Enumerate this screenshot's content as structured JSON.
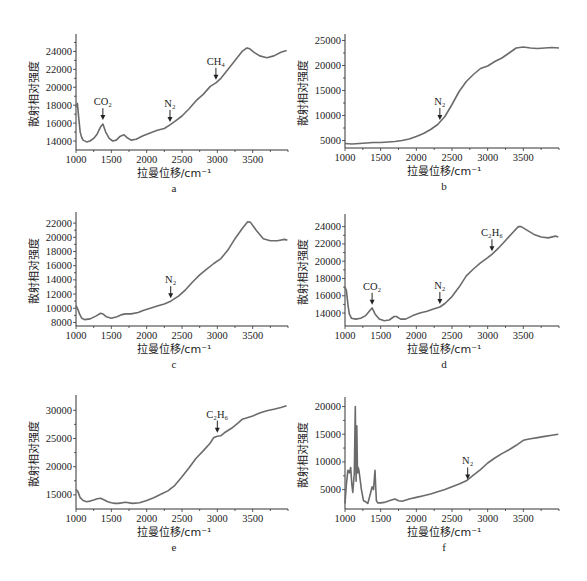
{
  "figure": {
    "panels": [
      "a",
      "b",
      "c",
      "d",
      "e",
      "f"
    ]
  },
  "chart_data": [
    {
      "id": "a",
      "type": "line",
      "title": "",
      "caption": "a",
      "xlabel": "拉曼位移/cm⁻¹",
      "ylabel": "散射相对强度",
      "xlim": [
        1000,
        4000
      ],
      "ylim": [
        13000,
        25500
      ],
      "xticks": [
        1000,
        1500,
        2000,
        2500,
        3000,
        3500
      ],
      "yticks": [
        14000,
        16000,
        18000,
        20000,
        22000,
        24000
      ],
      "grid": false,
      "annotations": [
        {
          "label": "CO₂",
          "x": 1380,
          "y": 16000
        },
        {
          "label": "N₂",
          "x": 2330,
          "y": 15800
        },
        {
          "label": "CH₄",
          "x": 2980,
          "y": 20500
        }
      ],
      "x": [
        1000,
        1020,
        1040,
        1060,
        1080,
        1100,
        1150,
        1200,
        1250,
        1300,
        1350,
        1380,
        1420,
        1470,
        1520,
        1570,
        1620,
        1680,
        1720,
        1780,
        1850,
        1950,
        2050,
        2150,
        2250,
        2330,
        2400,
        2500,
        2600,
        2700,
        2800,
        2900,
        2980,
        3050,
        3150,
        3250,
        3350,
        3420,
        3460,
        3520,
        3600,
        3700,
        3800,
        3900,
        3980
      ],
      "values": [
        17800,
        18200,
        16500,
        15000,
        14400,
        14100,
        13900,
        14000,
        14300,
        14800,
        15600,
        15900,
        15000,
        14300,
        14000,
        14100,
        14500,
        14700,
        14400,
        14100,
        14200,
        14600,
        14900,
        15200,
        15400,
        15800,
        16200,
        16800,
        17600,
        18500,
        19200,
        20100,
        20500,
        21000,
        22000,
        23000,
        24000,
        24400,
        24300,
        23900,
        23500,
        23300,
        23500,
        23900,
        24100
      ]
    },
    {
      "id": "b",
      "type": "line",
      "title": "",
      "caption": "b",
      "xlabel": "拉曼位移/cm⁻¹",
      "ylabel": "散射相对强度",
      "xlim": [
        1000,
        4000
      ],
      "ylim": [
        3500,
        25500
      ],
      "xticks": [
        1000,
        1500,
        2000,
        2500,
        3000,
        3500
      ],
      "yticks": [
        5000,
        10000,
        15000,
        20000,
        25000
      ],
      "grid": false,
      "annotations": [
        {
          "label": "N₂",
          "x": 2330,
          "y": 8500
        }
      ],
      "x": [
        1000,
        1100,
        1200,
        1300,
        1400,
        1500,
        1600,
        1700,
        1800,
        1900,
        2000,
        2100,
        2200,
        2300,
        2400,
        2500,
        2600,
        2700,
        2800,
        2900,
        3000,
        3100,
        3200,
        3300,
        3400,
        3500,
        3600,
        3700,
        3800,
        3900,
        4000
      ],
      "values": [
        4400,
        4300,
        4400,
        4500,
        4600,
        4600,
        4700,
        4800,
        5000,
        5300,
        5800,
        6400,
        7200,
        8200,
        9800,
        12200,
        14800,
        16800,
        18200,
        19400,
        19900,
        20800,
        21500,
        22500,
        23500,
        23700,
        23500,
        23400,
        23500,
        23600,
        23500
      ]
    },
    {
      "id": "c",
      "type": "line",
      "title": "",
      "caption": "c",
      "xlabel": "拉曼位移/cm⁻¹",
      "ylabel": "散射相对强度",
      "xlim": [
        1000,
        4000
      ],
      "ylim": [
        7500,
        23000
      ],
      "xticks": [
        1000,
        1500,
        2000,
        2500,
        3000,
        3500
      ],
      "yticks": [
        8000,
        10000,
        12000,
        14000,
        16000,
        18000,
        20000,
        22000
      ],
      "grid": false,
      "annotations": [
        {
          "label": "N₂",
          "x": 2340,
          "y": 11000
        }
      ],
      "x": [
        1000,
        1020,
        1050,
        1080,
        1120,
        1200,
        1280,
        1350,
        1380,
        1430,
        1500,
        1580,
        1650,
        1700,
        1780,
        1880,
        1950,
        2050,
        2150,
        2250,
        2340,
        2450,
        2550,
        2650,
        2750,
        2850,
        2950,
        3050,
        3150,
        3250,
        3350,
        3430,
        3470,
        3550,
        3650,
        3750,
        3850,
        3950,
        3990
      ],
      "values": [
        10400,
        10000,
        9200,
        8600,
        8400,
        8500,
        8900,
        9300,
        9200,
        8800,
        8600,
        8800,
        9100,
        9200,
        9200,
        9400,
        9700,
        10000,
        10300,
        10600,
        11000,
        11700,
        12600,
        13700,
        14700,
        15500,
        16300,
        17000,
        18200,
        19800,
        21200,
        22200,
        22100,
        21000,
        19800,
        19500,
        19500,
        19700,
        19600
      ]
    },
    {
      "id": "d",
      "type": "line",
      "title": "",
      "caption": "d",
      "xlabel": "拉曼位移/cm⁻¹",
      "ylabel": "散射相对强度",
      "xlim": [
        1000,
        4000
      ],
      "ylim": [
        12500,
        25000
      ],
      "xticks": [
        1000,
        1500,
        2000,
        2500,
        3000,
        3500
      ],
      "yticks": [
        14000,
        16000,
        18000,
        20000,
        22000,
        24000
      ],
      "grid": false,
      "annotations": [
        {
          "label": "CO₂",
          "x": 1380,
          "y": 14600
        },
        {
          "label": "N₂",
          "x": 2330,
          "y": 14700
        },
        {
          "label": "C₂H₆",
          "x": 3060,
          "y": 20800
        }
      ],
      "x": [
        1000,
        1020,
        1040,
        1060,
        1090,
        1150,
        1220,
        1290,
        1340,
        1380,
        1420,
        1480,
        1550,
        1620,
        1690,
        1720,
        1780,
        1850,
        1950,
        2050,
        2150,
        2250,
        2330,
        2400,
        2500,
        2600,
        2700,
        2800,
        2900,
        3000,
        3060,
        3150,
        3250,
        3350,
        3430,
        3470,
        3550,
        3650,
        3750,
        3850,
        3950,
        3990
      ],
      "values": [
        17000,
        16600,
        15000,
        13900,
        13400,
        13300,
        13400,
        13700,
        14200,
        14600,
        13900,
        13300,
        13100,
        13200,
        13600,
        13600,
        13300,
        13300,
        13700,
        14000,
        14200,
        14500,
        14700,
        15100,
        15900,
        17000,
        18300,
        19100,
        19800,
        20400,
        20800,
        21500,
        22400,
        23300,
        24000,
        24000,
        23600,
        23100,
        22800,
        22700,
        22900,
        22800
      ]
    },
    {
      "id": "e",
      "type": "line",
      "title": "",
      "caption": "e",
      "xlabel": "拉曼位移/cm⁻¹",
      "ylabel": "散射相对强度",
      "xlim": [
        1000,
        4000
      ],
      "ylim": [
        12500,
        32000
      ],
      "xticks": [
        1000,
        1500,
        2000,
        2500,
        3000,
        3500
      ],
      "yticks": [
        15000,
        20000,
        25000,
        30000
      ],
      "grid": false,
      "annotations": [
        {
          "label": "C₂H₆",
          "x": 3000,
          "y": 25500
        }
      ],
      "x": [
        1000,
        1030,
        1060,
        1100,
        1150,
        1200,
        1250,
        1300,
        1350,
        1400,
        1450,
        1500,
        1550,
        1600,
        1700,
        1800,
        1900,
        2000,
        2100,
        2200,
        2300,
        2400,
        2500,
        2600,
        2700,
        2800,
        2900,
        2950,
        3000,
        3050,
        3100,
        3200,
        3300,
        3350,
        3400,
        3500,
        3600,
        3700,
        3800,
        3900,
        3980
      ],
      "values": [
        16000,
        15500,
        14500,
        14000,
        13800,
        13900,
        14100,
        14300,
        14400,
        14100,
        13800,
        13600,
        13500,
        13500,
        13700,
        13500,
        13600,
        14000,
        14500,
        15100,
        15700,
        16700,
        18200,
        19800,
        21500,
        22800,
        24200,
        25200,
        25400,
        25500,
        26000,
        26800,
        27800,
        28400,
        28600,
        29000,
        29500,
        29900,
        30200,
        30500,
        30800
      ]
    },
    {
      "id": "f",
      "type": "line",
      "title": "",
      "caption": "f",
      "xlabel": "拉曼位移/cm⁻¹",
      "ylabel": "散射相对强度",
      "xlim": [
        1000,
        4000
      ],
      "ylim": [
        1500,
        21000
      ],
      "xticks": [
        1000,
        1500,
        2000,
        2500,
        3000,
        3500
      ],
      "yticks": [
        5000,
        10000,
        15000,
        20000
      ],
      "grid": false,
      "annotations": [
        {
          "label": "N₂",
          "x": 2720,
          "y": 6300
        }
      ],
      "x": [
        1000,
        1020,
        1040,
        1060,
        1080,
        1095,
        1110,
        1130,
        1145,
        1155,
        1165,
        1175,
        1185,
        1195,
        1210,
        1230,
        1260,
        1290,
        1320,
        1350,
        1380,
        1400,
        1420,
        1430,
        1440,
        1460,
        1500,
        1550,
        1600,
        1650,
        1700,
        1750,
        1800,
        1900,
        2000,
        2100,
        2200,
        2300,
        2400,
        2500,
        2600,
        2700,
        2800,
        2900,
        3000,
        3100,
        3200,
        3300,
        3400,
        3500,
        3600,
        3700,
        3800,
        3900,
        3990
      ],
      "values": [
        2500,
        6000,
        8500,
        8000,
        9000,
        6000,
        4500,
        8000,
        20000,
        6500,
        16500,
        8000,
        9000,
        8500,
        7000,
        5000,
        3000,
        2800,
        2500,
        4000,
        5500,
        5000,
        8500,
        5500,
        3000,
        2600,
        2600,
        2700,
        2900,
        3100,
        3300,
        3000,
        2900,
        3300,
        3600,
        3900,
        4200,
        4600,
        5000,
        5500,
        6000,
        6600,
        7600,
        8600,
        9800,
        10700,
        11500,
        12200,
        13000,
        13900,
        14200,
        14400,
        14600,
        14800,
        15000
      ]
    }
  ]
}
